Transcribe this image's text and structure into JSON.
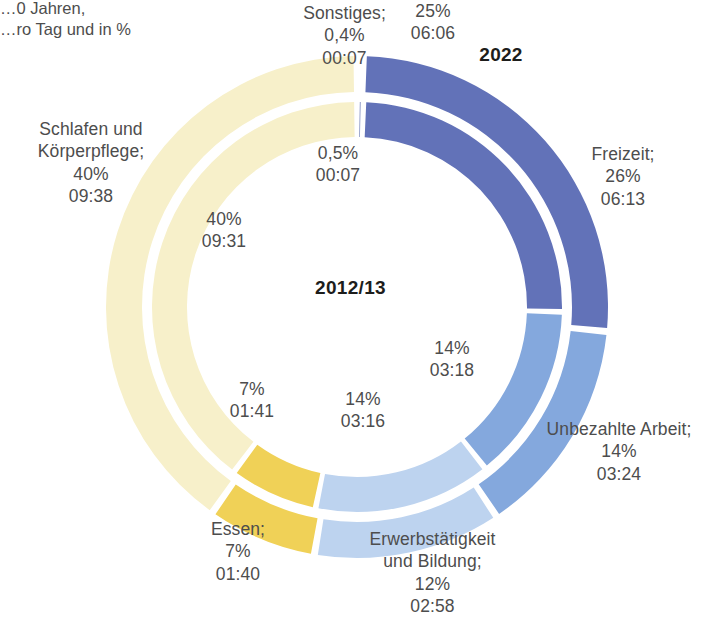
{
  "subtitle": "…0 Jahren,\n…ro Tag und in %",
  "rings": {
    "outer": {
      "label": "2022"
    },
    "inner": {
      "label": "2012/13"
    }
  },
  "colors": {
    "freizeit": "#6272b8",
    "unbezahlte_arbeit": "#84a8dd",
    "erwerbstaetigkeit": "#bdd3ef",
    "essen": "#f0d157",
    "schlafen": "#f7f0ca",
    "sonstiges": "#5e6fae",
    "text": "#4d4d4d",
    "title_text": "#1d1d1b",
    "background": "#ffffff"
  },
  "callouts": {
    "sonstiges": "Sonstiges;\n0,4%\n00:07",
    "freizeit": "Freizeit;\n26%\n06:13",
    "unbezahlte_arbeit": "Unbezahlte Arbeit;\n14%\n03:24",
    "erwerbstaetigkeit": "Erwerbstätigkeit\nund Bildung;\n12%\n02:58",
    "essen": "Essen;\n7%\n01:40",
    "schlafen": "Schlafen und\nKörperpflege;\n40%\n09:38"
  },
  "inner_values": {
    "sonstiges": "0,5%\n00:07",
    "freizeit": "25%\n06:06",
    "unbezahlte_arbeit": "14%\n03:18",
    "erwerbstaetigkeit": "14%\n03:16",
    "essen": "7%\n01:41",
    "schlafen": "40%\n09:31"
  },
  "chart_data": {
    "type": "pie",
    "title": "",
    "legend": "labels-on-slices",
    "grid": false,
    "categories": [
      "Sonstiges",
      "Freizeit",
      "Unbezahlte Arbeit",
      "Erwerbstätigkeit und Bildung",
      "Essen",
      "Schlafen und Körperpflege"
    ],
    "series": [
      {
        "name": "2022",
        "ring": "outer",
        "values": [
          0.4,
          26,
          14,
          12,
          7,
          40
        ],
        "durations": [
          "00:07",
          "06:13",
          "03:24",
          "02:58",
          "01:40",
          "09:38"
        ]
      },
      {
        "name": "2012/13",
        "ring": "inner",
        "values": [
          0.5,
          25,
          14,
          14,
          7,
          40
        ],
        "durations": [
          "00:07",
          "06:06",
          "03:18",
          "03:16",
          "01:41",
          "09:31"
        ]
      }
    ],
    "slice_colors": [
      "#5e6fae",
      "#6272b8",
      "#84a8dd",
      "#bdd3ef",
      "#f0d157",
      "#f7f0ca"
    ],
    "units": "Stunden pro Tag und in %"
  }
}
